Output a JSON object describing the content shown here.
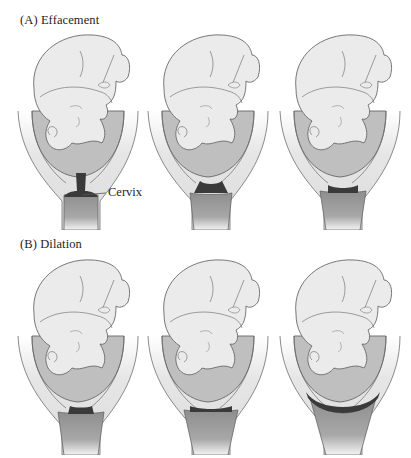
{
  "figure": {
    "sections": [
      {
        "id": "A",
        "label": "(A)  Effacement",
        "panels": [
          {
            "stage": 1,
            "cervix_state": "long-closed",
            "callout": "Cervix"
          },
          {
            "stage": 2,
            "cervix_state": "shortening"
          },
          {
            "stage": 3,
            "cervix_state": "effaced"
          }
        ]
      },
      {
        "id": "B",
        "label": "(B)  Dilation",
        "panels": [
          {
            "stage": 1,
            "cervix_state": "thin-closed"
          },
          {
            "stage": 2,
            "cervix_state": "partially-dilated"
          },
          {
            "stage": 3,
            "cervix_state": "fully-dilated"
          }
        ]
      }
    ],
    "colors": {
      "background": "#ffffff",
      "outline": "#6a6a6a",
      "fetus_fill": "#e9e9e9",
      "uterus_wall": "#e2e2e2",
      "amniotic_fluid": "#bdbdbd",
      "cervix": "#3c3c3c",
      "vaginal_canal": "#9a9a9a"
    }
  }
}
